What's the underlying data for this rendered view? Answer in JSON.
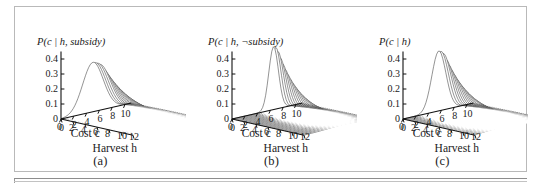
{
  "figure": {
    "panels": [
      {
        "id": "a",
        "caption": "(a)",
        "z_title_prefix": "P(",
        "z_title": "P(c | h, subsidy)",
        "title_parts": {
          "p": "P(",
          "c": "c",
          "bar": " | ",
          "h": "h",
          "rest": ", subsidy)"
        },
        "x_axis_label": "Cost c",
        "x_axis_label_plain": "Cost",
        "x_axis_var": "c",
        "y_axis_label": "Harvest h",
        "y_axis_label_plain": "Harvest",
        "y_axis_var": "h",
        "z_ticks": [
          "0.4",
          "0.3",
          "0.2",
          "0.1",
          "0"
        ],
        "x_ticks": [
          "0",
          "2",
          "4",
          "6",
          "8",
          "10"
        ],
        "y_ticks": [
          "0",
          "2",
          "4",
          "6",
          "8",
          "10",
          "12"
        ]
      },
      {
        "id": "b",
        "caption": "(b)",
        "z_title": "P(c | h, ¬subsidy)",
        "title_parts": {
          "p": "P(",
          "c": "c",
          "bar": " | ",
          "h": "h",
          "rest": ", ¬subsidy)"
        },
        "x_axis_label": "Cost c",
        "x_axis_label_plain": "Cost",
        "x_axis_var": "c",
        "y_axis_label": "Harvest h",
        "y_axis_label_plain": "Harvest",
        "y_axis_var": "h",
        "z_ticks": [
          "0.4",
          "0.3",
          "0.2",
          "0.1",
          "0"
        ],
        "x_ticks": [
          "0",
          "2",
          "4",
          "6",
          "8",
          "10"
        ],
        "y_ticks": [
          "0",
          "2",
          "4",
          "6",
          "8",
          "10",
          "12"
        ]
      },
      {
        "id": "c",
        "caption": "(c)",
        "z_title": "P(c | h)",
        "title_parts": {
          "p": "P(",
          "c": "c",
          "bar": " | ",
          "h": "h",
          "rest": ")"
        },
        "x_axis_label": "Cost c",
        "x_axis_label_plain": "Cost",
        "x_axis_var": "c",
        "y_axis_label": "Harvest h",
        "y_axis_label_plain": "Harvest",
        "y_axis_var": "h",
        "z_ticks": [
          "0.4",
          "0.3",
          "0.2",
          "0.1",
          "0"
        ],
        "x_ticks": [
          "0",
          "2",
          "4",
          "6",
          "8",
          "10"
        ],
        "y_ticks": [
          "0",
          "2",
          "4",
          "6",
          "8",
          "10",
          "12"
        ]
      }
    ]
  },
  "chart_data": [
    {
      "type": "surface",
      "panel": "a",
      "title": "P(c | h, subsidy)",
      "xlabel": "Cost c",
      "ylabel": "Harvest h",
      "zlabel": "P(c | h, subsidy)",
      "xlim": [
        0,
        11
      ],
      "ylim": [
        0,
        12
      ],
      "zlim": [
        0,
        0.45
      ],
      "xticks": [
        0,
        2,
        4,
        6,
        8,
        10
      ],
      "yticks": [
        0,
        2,
        4,
        6,
        8,
        10,
        12
      ],
      "zticks": [
        0,
        0.1,
        0.2,
        0.3,
        0.4
      ],
      "grid": false,
      "legend": "none",
      "mesh": {
        "form": "gaussian-ridge",
        "peak_z": 0.33,
        "peak_cost": 5.0,
        "peak_harvest": 1.0,
        "cost_sigma_at_low_harvest": 1.6,
        "cost_sigma_at_high_harvest": 3.2,
        "decay_along_harvest": 0.22,
        "note": "broad ridge peaking near low harvest, spreading and flattening as harvest grows"
      }
    },
    {
      "type": "surface",
      "panel": "b",
      "title": "P(c | h, ¬subsidy)",
      "xlabel": "Cost c",
      "ylabel": "Harvest h",
      "zlabel": "P(c | h, ¬subsidy)",
      "xlim": [
        0,
        11
      ],
      "ylim": [
        0,
        12
      ],
      "zlim": [
        0,
        0.45
      ],
      "xticks": [
        0,
        2,
        4,
        6,
        8,
        10
      ],
      "yticks": [
        0,
        2,
        4,
        6,
        8,
        10,
        12
      ],
      "zticks": [
        0,
        0.1,
        0.2,
        0.3,
        0.4
      ],
      "grid": false,
      "legend": "none",
      "mesh": {
        "form": "gaussian-ridge",
        "peak_z": 0.42,
        "peak_cost": 6.5,
        "peak_harvest": 0.5,
        "cost_sigma_at_low_harvest": 0.75,
        "cost_sigma_at_high_harvest": 2.6,
        "decay_along_harvest": 0.3,
        "note": "very narrow tall ridge at low harvest, rapidly flattening"
      }
    },
    {
      "type": "surface",
      "panel": "c",
      "title": "P(c | h)",
      "xlabel": "Cost c",
      "ylabel": "Harvest h",
      "zlabel": "P(c | h)",
      "xlim": [
        0,
        11
      ],
      "ylim": [
        0,
        12
      ],
      "zlim": [
        0,
        0.45
      ],
      "xticks": [
        0,
        2,
        4,
        6,
        8,
        10
      ],
      "yticks": [
        0,
        2,
        4,
        6,
        8,
        10,
        12
      ],
      "zticks": [
        0,
        0.1,
        0.2,
        0.3,
        0.4
      ],
      "grid": false,
      "legend": "none",
      "mesh": {
        "form": "gaussian-ridge",
        "peak_z": 0.4,
        "peak_cost": 5.6,
        "peak_harvest": 0.6,
        "cost_sigma_at_low_harvest": 1.1,
        "cost_sigma_at_high_harvest": 3.0,
        "decay_along_harvest": 0.26,
        "note": "tall central peak at low harvest tapering to a broad flat sheet"
      }
    }
  ],
  "style": {
    "border_color": "#b9b9b9",
    "rule_color": "#8d8d8d",
    "mesh_color": "#3a3a3a",
    "fill_color": "#8f8f8f",
    "background": "#ffffff"
  }
}
